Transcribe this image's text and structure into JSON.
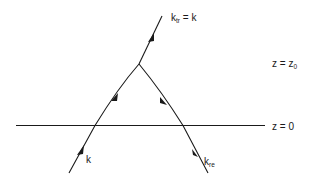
{
  "diagram": {
    "interfaces": [
      {
        "id": "upper",
        "label_var": "z",
        "label_eq": " = ",
        "label_val": "z",
        "label_sub": "0"
      },
      {
        "id": "lower",
        "label_var": "z",
        "label_eq": " = ",
        "label_val": "0",
        "label_sub": ""
      }
    ],
    "rays": {
      "incident": {
        "label": "k",
        "sub": ""
      },
      "transmitted": {
        "label": "k",
        "sub": "tr",
        "suffix": " = k"
      },
      "reflected": {
        "label": "k",
        "sub": "re"
      }
    },
    "colors": {
      "line": "#1a1a1a",
      "background": "#ffffff"
    }
  }
}
